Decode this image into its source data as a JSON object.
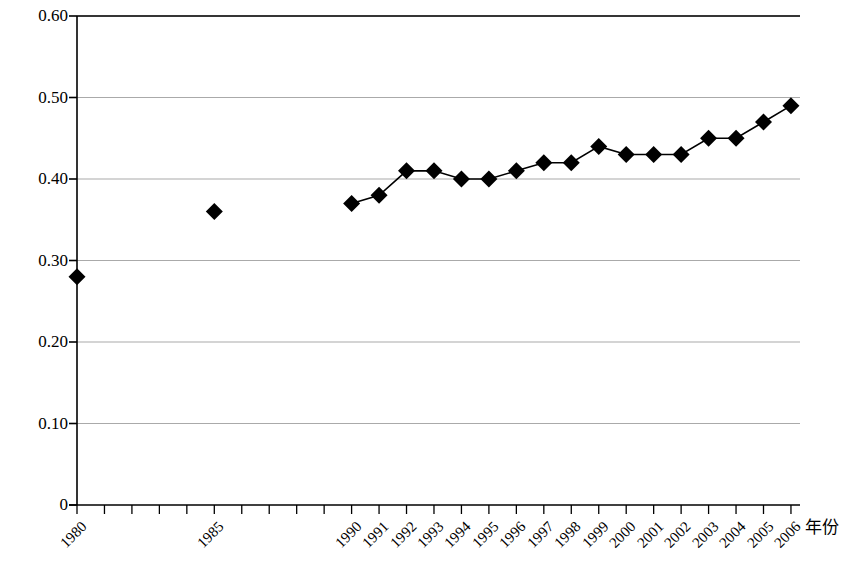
{
  "chart_data": {
    "type": "line",
    "title": "",
    "subtitle": "",
    "xlabel": "年份",
    "ylabel": "",
    "grid": true,
    "legend": false,
    "marker": "diamond",
    "marker_color": "#000000",
    "line_color": "#000000",
    "axis_color": "#000000",
    "grid_color": "#aaaaaa",
    "xlim": [
      "1980",
      "2006"
    ],
    "ylim": [
      0,
      0.6
    ],
    "ytick_labels": [
      "0.60",
      "0.50",
      "0.40",
      "0.30",
      "0.20",
      "0.10",
      "0"
    ],
    "ytick_values": [
      0.6,
      0.5,
      0.4,
      0.3,
      0.2,
      0.1,
      0
    ],
    "xtick_labels": [
      "1980",
      "",
      "",
      "",
      "",
      "1985",
      "",
      "",
      "",
      "",
      "1990",
      "1991",
      "1992",
      "1993",
      "1994",
      "1995",
      "1996",
      "1997",
      "1998",
      "1999",
      "2000",
      "2001",
      "2002",
      "2003",
      "2004",
      "2005",
      "2006"
    ],
    "categories": [
      "1980",
      "1981",
      "1982",
      "1983",
      "1984",
      "1985",
      "1986",
      "1987",
      "1988",
      "1989",
      "1990",
      "1991",
      "1992",
      "1993",
      "1994",
      "1995",
      "1996",
      "1997",
      "1998",
      "1999",
      "2000",
      "2001",
      "2002",
      "2003",
      "2004",
      "2005",
      "2006"
    ],
    "values": [
      0.28,
      null,
      null,
      null,
      null,
      0.36,
      null,
      null,
      null,
      null,
      0.37,
      0.38,
      0.41,
      0.41,
      0.4,
      0.4,
      0.41,
      0.42,
      0.42,
      0.44,
      0.43,
      0.43,
      0.43,
      0.45,
      0.45,
      0.47,
      0.49
    ],
    "series": [
      {
        "name": "",
        "points": [
          {
            "x": "1980",
            "y": 0.28
          },
          {
            "x": "1985",
            "y": 0.36
          },
          {
            "x": "1990",
            "y": 0.37
          },
          {
            "x": "1991",
            "y": 0.38
          },
          {
            "x": "1992",
            "y": 0.41
          },
          {
            "x": "1993",
            "y": 0.41
          },
          {
            "x": "1994",
            "y": 0.4
          },
          {
            "x": "1995",
            "y": 0.4
          },
          {
            "x": "1996",
            "y": 0.41
          },
          {
            "x": "1997",
            "y": 0.42
          },
          {
            "x": "1998",
            "y": 0.42
          },
          {
            "x": "1999",
            "y": 0.44
          },
          {
            "x": "2000",
            "y": 0.43
          },
          {
            "x": "2001",
            "y": 0.43
          },
          {
            "x": "2002",
            "y": 0.43
          },
          {
            "x": "2003",
            "y": 0.45
          },
          {
            "x": "2004",
            "y": 0.45
          },
          {
            "x": "2005",
            "y": 0.47
          },
          {
            "x": "2006",
            "y": 0.49
          }
        ],
        "connected_from": "1990"
      }
    ],
    "annotations": []
  }
}
